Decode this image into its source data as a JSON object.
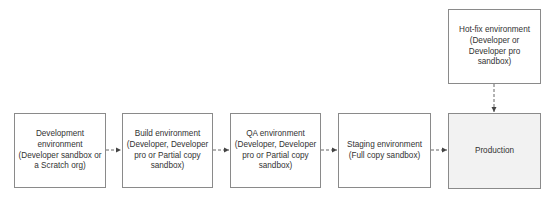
{
  "diagram": {
    "type": "flowchart",
    "direction": "left-to-right",
    "nodes": [
      {
        "id": "dev",
        "label": "Development environment (Developer sandbox or a Scratch org)"
      },
      {
        "id": "build",
        "label": "Build environment (Developer, Developer pro or Partial copy sandbox)"
      },
      {
        "id": "qa",
        "label": "QA environment (Developer, Developer pro or Partial copy sandbox)"
      },
      {
        "id": "staging",
        "label": "Staging environment (Full copy sandbox)"
      },
      {
        "id": "production",
        "label": "Production"
      },
      {
        "id": "hotfix",
        "label": "Hot-fix environment (Developer or Developer pro sandbox)"
      }
    ],
    "edges": [
      {
        "from": "dev",
        "to": "build",
        "style": "dashed"
      },
      {
        "from": "build",
        "to": "qa",
        "style": "dashed"
      },
      {
        "from": "qa",
        "to": "staging",
        "style": "dashed"
      },
      {
        "from": "staging",
        "to": "production",
        "style": "dashed"
      },
      {
        "from": "hotfix",
        "to": "production",
        "style": "dashed"
      }
    ],
    "colors": {
      "border": "#8a8a8a",
      "text": "#333333",
      "production_fill": "#f2f2f2",
      "arrow": "#555555"
    }
  }
}
